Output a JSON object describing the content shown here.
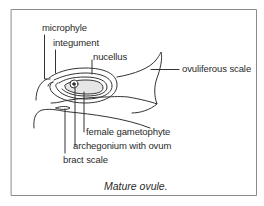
{
  "figure": {
    "caption": "Mature ovule.",
    "labels": {
      "microphyle": "microphyle",
      "integument": "integument",
      "nucellus": "nucellus",
      "ovuliferous_scale": "ovuliferous scale",
      "female_gametophyte": "female gametophyte",
      "archegonium": "archegonium with ovum",
      "bract_scale": "bract scale"
    },
    "colors": {
      "stroke": "#333333",
      "frame": "#8a8a8a",
      "gametophyte_fill": "#e6e6e6",
      "text": "#2a2a2a"
    }
  }
}
